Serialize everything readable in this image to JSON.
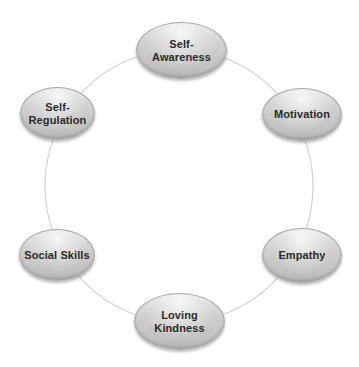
{
  "diagram": {
    "type": "cycle",
    "ring_color": "#d0d0d0",
    "node_fill": "#cccccc",
    "node_text_color": "#2a2a2a",
    "nodes": [
      {
        "id": "self-awareness",
        "label": "Self-\nAwareness"
      },
      {
        "id": "motivation",
        "label": "Motivation"
      },
      {
        "id": "empathy",
        "label": "Empathy"
      },
      {
        "id": "loving-kindness",
        "label": "Loving\nKindness"
      },
      {
        "id": "social-skills",
        "label": "Social Skills"
      },
      {
        "id": "self-regulation",
        "label": "Self-\nRegulation"
      }
    ]
  }
}
